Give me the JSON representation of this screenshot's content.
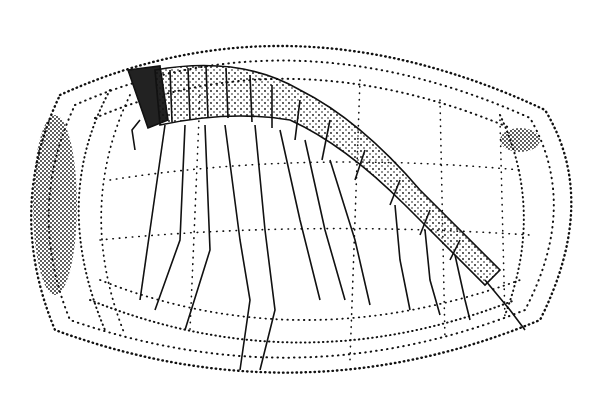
{
  "figure": {
    "style": "black stipple and ink line illustration",
    "colors": {
      "background": "#ffffff",
      "ink": "#111111"
    },
    "caption": ""
  }
}
